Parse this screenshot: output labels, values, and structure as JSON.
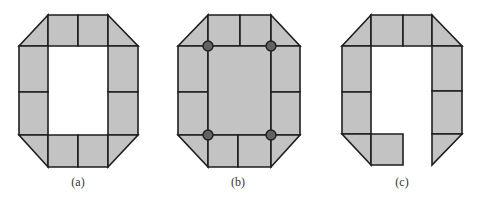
{
  "colors": {
    "fill": "#c3c3c3",
    "stroke": "#1e1e1e",
    "node_fill": "#626262",
    "background": "#ffffff"
  },
  "figures": [
    {
      "id": "a",
      "caption": "(a)",
      "caption_pos": [
        78,
        186
      ],
      "polygons": [
        [
          [
            19,
            46
          ],
          [
            48,
            15
          ],
          [
            48,
            46
          ]
        ],
        [
          [
            48,
            15
          ],
          [
            78,
            15
          ],
          [
            78,
            46
          ],
          [
            48,
            46
          ]
        ],
        [
          [
            78,
            15
          ],
          [
            108,
            15
          ],
          [
            108,
            46
          ],
          [
            78,
            46
          ]
        ],
        [
          [
            108,
            15
          ],
          [
            138,
            46
          ],
          [
            108,
            46
          ]
        ],
        [
          [
            19,
            46
          ],
          [
            48,
            46
          ],
          [
            48,
            92
          ],
          [
            19,
            92
          ]
        ],
        [
          [
            19,
            92
          ],
          [
            48,
            92
          ],
          [
            48,
            135
          ],
          [
            19,
            135
          ]
        ],
        [
          [
            108,
            46
          ],
          [
            138,
            46
          ],
          [
            138,
            92
          ],
          [
            108,
            92
          ]
        ],
        [
          [
            108,
            92
          ],
          [
            138,
            92
          ],
          [
            138,
            135
          ],
          [
            108,
            135
          ]
        ],
        [
          [
            19,
            135
          ],
          [
            48,
            135
          ],
          [
            48,
            167
          ]
        ],
        [
          [
            48,
            135
          ],
          [
            78,
            135
          ],
          [
            78,
            167
          ],
          [
            48,
            167
          ]
        ],
        [
          [
            78,
            135
          ],
          [
            108,
            135
          ],
          [
            108,
            167
          ],
          [
            78,
            167
          ]
        ],
        [
          [
            108,
            135
          ],
          [
            138,
            135
          ],
          [
            108,
            167
          ]
        ]
      ],
      "nodes": []
    },
    {
      "id": "b",
      "caption": "(b)",
      "caption_pos": [
        238,
        186
      ],
      "polygons": [
        [
          [
            178,
            46
          ],
          [
            208,
            15
          ],
          [
            208,
            46
          ]
        ],
        [
          [
            208,
            15
          ],
          [
            240,
            15
          ],
          [
            240,
            46
          ],
          [
            208,
            46
          ]
        ],
        [
          [
            240,
            15
          ],
          [
            271,
            15
          ],
          [
            271,
            46
          ],
          [
            240,
            46
          ]
        ],
        [
          [
            271,
            15
          ],
          [
            300,
            46
          ],
          [
            271,
            46
          ]
        ],
        [
          [
            178,
            46
          ],
          [
            208,
            46
          ],
          [
            208,
            92
          ],
          [
            178,
            92
          ]
        ],
        [
          [
            178,
            92
          ],
          [
            208,
            92
          ],
          [
            208,
            135
          ],
          [
            178,
            135
          ]
        ],
        [
          [
            208,
            46
          ],
          [
            271,
            46
          ],
          [
            271,
            135
          ],
          [
            208,
            135
          ]
        ],
        [
          [
            271,
            46
          ],
          [
            300,
            46
          ],
          [
            300,
            92
          ],
          [
            271,
            92
          ]
        ],
        [
          [
            271,
            92
          ],
          [
            300,
            92
          ],
          [
            300,
            135
          ],
          [
            271,
            135
          ]
        ],
        [
          [
            178,
            135
          ],
          [
            208,
            135
          ],
          [
            208,
            167
          ]
        ],
        [
          [
            208,
            135
          ],
          [
            238,
            135
          ],
          [
            238,
            167
          ],
          [
            208,
            167
          ]
        ],
        [
          [
            238,
            135
          ],
          [
            271,
            135
          ],
          [
            271,
            167
          ],
          [
            238,
            167
          ]
        ],
        [
          [
            271,
            135
          ],
          [
            300,
            135
          ],
          [
            271,
            167
          ]
        ]
      ],
      "nodes": [
        [
          208,
          46
        ],
        [
          271,
          46
        ],
        [
          208,
          135
        ],
        [
          271,
          135
        ]
      ]
    },
    {
      "id": "c",
      "caption": "(c)",
      "caption_pos": [
        402,
        186
      ],
      "polygons": [
        [
          [
            342,
            46
          ],
          [
            371,
            15
          ],
          [
            371,
            46
          ]
        ],
        [
          [
            371,
            15
          ],
          [
            403,
            15
          ],
          [
            403,
            46
          ],
          [
            371,
            46
          ]
        ],
        [
          [
            403,
            15
          ],
          [
            432,
            15
          ],
          [
            432,
            46
          ],
          [
            403,
            46
          ]
        ],
        [
          [
            432,
            15
          ],
          [
            462,
            46
          ],
          [
            432,
            46
          ]
        ],
        [
          [
            342,
            46
          ],
          [
            371,
            46
          ],
          [
            371,
            92
          ],
          [
            342,
            92
          ]
        ],
        [
          [
            342,
            92
          ],
          [
            371,
            92
          ],
          [
            371,
            134
          ],
          [
            342,
            134
          ]
        ],
        [
          [
            432,
            46
          ],
          [
            462,
            46
          ],
          [
            462,
            91
          ],
          [
            432,
            91
          ]
        ],
        [
          [
            432,
            91
          ],
          [
            462,
            91
          ],
          [
            462,
            134
          ],
          [
            432,
            134
          ]
        ],
        [
          [
            342,
            134
          ],
          [
            371,
            134
          ],
          [
            371,
            165
          ]
        ],
        [
          [
            371,
            134
          ],
          [
            403,
            134
          ],
          [
            403,
            165
          ],
          [
            371,
            165
          ]
        ],
        [
          [
            432,
            134
          ],
          [
            462,
            134
          ],
          [
            432,
            165
          ]
        ]
      ],
      "nodes": []
    }
  ]
}
